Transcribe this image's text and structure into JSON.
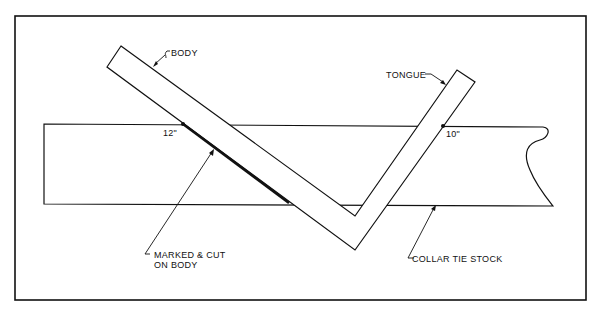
{
  "diagram": {
    "labels": {
      "body": "BODY",
      "tongue": "TONGUE",
      "mark_12": "12\"",
      "mark_10": "10\"",
      "marked_cut_line1": "MARKED & CUT",
      "marked_cut_line2": "ON BODY",
      "collar_tie_stock": "COLLAR TIE STOCK"
    },
    "colors": {
      "line": "#111111",
      "background": "#ffffff"
    }
  }
}
